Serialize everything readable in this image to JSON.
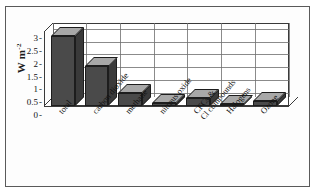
{
  "figure": {
    "border_color": "#5a5a5a",
    "background": "#ffffff"
  },
  "axis": {
    "y_title_main": "W m",
    "y_title_exp": "-2",
    "tick_dash": "-"
  },
  "colors": {
    "bar_front": "#4a4a4a",
    "bar_top": "#a8a8a8",
    "bar_side": "#3a3a3a",
    "bar_outline": "#1d1d1d",
    "grid": "#6e6e6e",
    "axis_line": "#3a3a3a"
  },
  "chart_data": {
    "type": "bar",
    "title": "",
    "xlabel": "",
    "ylabel": "W m-2",
    "ylim": [
      0,
      3.25
    ],
    "yticks": [
      0,
      0.5,
      1,
      1.5,
      2,
      2.5,
      3
    ],
    "ytick_labels": [
      "0",
      "0.5",
      "1",
      "1.5",
      "2",
      "2.5",
      "3"
    ],
    "grid": true,
    "legend": "none",
    "three_d": true,
    "categories": [
      "total",
      "carbon dioxide",
      "methane",
      "nitrous oxide",
      "CFCs &\nCl compounds",
      "Halogens",
      "Ozone"
    ],
    "values": [
      2.75,
      1.55,
      0.5,
      0.1,
      0.3,
      0.05,
      0.2
    ]
  },
  "categories_display": [
    {
      "line1": "total",
      "line2": ""
    },
    {
      "line1": "carbon dioxide",
      "line2": ""
    },
    {
      "line1": "methane",
      "line2": ""
    },
    {
      "line1": "nitrous oxide",
      "line2": ""
    },
    {
      "line1": "CFCs &",
      "line2": "Cl compounds"
    },
    {
      "line1": "Halogens",
      "line2": ""
    },
    {
      "line1": "Ozone",
      "line2": ""
    }
  ]
}
